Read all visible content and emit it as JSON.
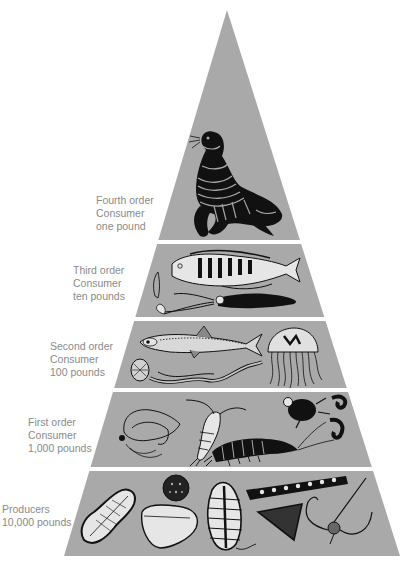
{
  "diagram": {
    "type": "food-pyramid",
    "colors": {
      "background": "#ffffff",
      "pyramid_fill": "#a9a9a9",
      "divider": "#ffffff",
      "ink": "#111111",
      "label_text": "#8a8a8a"
    },
    "tiers": [
      {
        "level": "Fourth order",
        "role": "Consumer",
        "mass": "one pound",
        "organisms": [
          "seal"
        ]
      },
      {
        "level": "Third order",
        "role": "Consumer",
        "mass": "ten pounds",
        "organisms": [
          "fish",
          "squid"
        ]
      },
      {
        "level": "Second order",
        "role": "Consumer",
        "mass": "100 pounds",
        "organisms": [
          "small-fish",
          "comb-jelly",
          "worm",
          "jellyfish"
        ]
      },
      {
        "level": "First order",
        "role": "Consumer",
        "mass": "1,000 pounds",
        "organisms": [
          "larva",
          "copepod",
          "shrimp",
          "water-beetle",
          "crab-larva"
        ]
      },
      {
        "level": "Producers",
        "role": "",
        "mass": "10,000 pounds",
        "organisms": [
          "diatom-pennate",
          "radiolarian",
          "diatom-oval",
          "dinoflagellate",
          "diatom-chain",
          "diatom-triangle",
          "spined-diatom"
        ]
      }
    ]
  }
}
